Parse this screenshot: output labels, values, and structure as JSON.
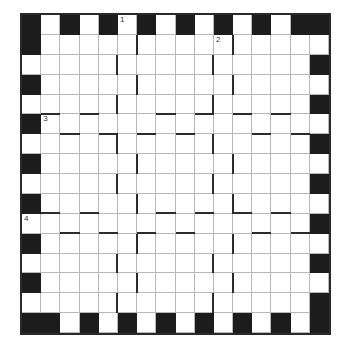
{
  "puzzle": {
    "rows": 16,
    "cols": 16,
    "colors": {
      "black": "#1c1c1c",
      "white": "#ffffff",
      "gridline": "#b8b8b8",
      "wall": "#2b2b2b"
    },
    "black_cells": {
      "row_0": [
        0,
        2,
        4,
        6,
        8,
        10,
        12,
        14,
        15
      ],
      "row_1": [
        0
      ],
      "row_2": [
        15
      ],
      "row_3": [
        0
      ],
      "row_4": [
        15
      ],
      "row_5": [
        0
      ],
      "row_6": [
        15
      ],
      "row_7": [
        0
      ],
      "row_8": [
        15
      ],
      "row_9": [
        0
      ],
      "row_10": [
        15
      ],
      "row_11": [
        0
      ],
      "row_12": [
        15
      ],
      "row_13": [
        0
      ],
      "row_14": [
        15
      ],
      "row_15": [
        0,
        1,
        3,
        5,
        7,
        9,
        11,
        13,
        15
      ]
    },
    "clue_numbers": [
      {
        "label": "1",
        "row": 0,
        "col": 5
      },
      {
        "label": "2",
        "row": 1,
        "col": 10
      },
      {
        "label": "3",
        "row": 5,
        "col": 1
      },
      {
        "label": "4",
        "row": 10,
        "col": 0
      }
    ],
    "vertical_walls": [
      {
        "row": 1,
        "col_edge": 6
      },
      {
        "row": 1,
        "col_edge": 11
      },
      {
        "row": 2,
        "col_edge": 5
      },
      {
        "row": 2,
        "col_edge": 10
      },
      {
        "row": 3,
        "col_edge": 6
      },
      {
        "row": 3,
        "col_edge": 11
      },
      {
        "row": 4,
        "col_edge": 5
      },
      {
        "row": 4,
        "col_edge": 10
      },
      {
        "row": 6,
        "col_edge": 5
      },
      {
        "row": 6,
        "col_edge": 10
      },
      {
        "row": 7,
        "col_edge": 6
      },
      {
        "row": 7,
        "col_edge": 11
      },
      {
        "row": 8,
        "col_edge": 5
      },
      {
        "row": 8,
        "col_edge": 10
      },
      {
        "row": 9,
        "col_edge": 6
      },
      {
        "row": 9,
        "col_edge": 11
      },
      {
        "row": 11,
        "col_edge": 6
      },
      {
        "row": 11,
        "col_edge": 11
      },
      {
        "row": 12,
        "col_edge": 5
      },
      {
        "row": 12,
        "col_edge": 10
      },
      {
        "row": 13,
        "col_edge": 6
      },
      {
        "row": 13,
        "col_edge": 11
      },
      {
        "row": 14,
        "col_edge": 5
      },
      {
        "row": 14,
        "col_edge": 10
      }
    ],
    "horizontal_walls": [
      {
        "row_edge": 5,
        "col": 1
      },
      {
        "row_edge": 5,
        "col": 3
      },
      {
        "row_edge": 5,
        "col": 7
      },
      {
        "row_edge": 5,
        "col": 9
      },
      {
        "row_edge": 5,
        "col": 11
      },
      {
        "row_edge": 5,
        "col": 13
      },
      {
        "row_edge": 6,
        "col": 2
      },
      {
        "row_edge": 6,
        "col": 4
      },
      {
        "row_edge": 6,
        "col": 6
      },
      {
        "row_edge": 6,
        "col": 8
      },
      {
        "row_edge": 6,
        "col": 12
      },
      {
        "row_edge": 6,
        "col": 14
      },
      {
        "row_edge": 10,
        "col": 1
      },
      {
        "row_edge": 10,
        "col": 3
      },
      {
        "row_edge": 10,
        "col": 7
      },
      {
        "row_edge": 10,
        "col": 9
      },
      {
        "row_edge": 10,
        "col": 11
      },
      {
        "row_edge": 10,
        "col": 13
      },
      {
        "row_edge": 11,
        "col": 2
      },
      {
        "row_edge": 11,
        "col": 4
      },
      {
        "row_edge": 11,
        "col": 6
      },
      {
        "row_edge": 11,
        "col": 8
      },
      {
        "row_edge": 11,
        "col": 12
      },
      {
        "row_edge": 11,
        "col": 14
      }
    ]
  }
}
